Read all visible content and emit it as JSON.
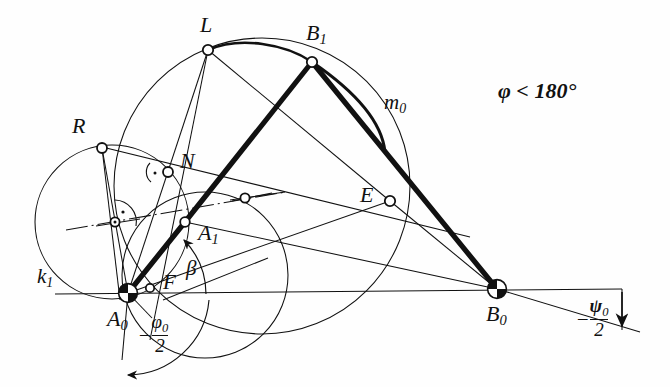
{
  "figure": {
    "type": "geometric-construction-diagram",
    "condition_note": "φ < 180°",
    "background_color": "#fefefe",
    "ink_color": "#111111"
  },
  "labels": {
    "L": "L",
    "B1_base": "B",
    "B1_sub": "1",
    "R": "R",
    "N": "N",
    "A1_base": "A",
    "A1_sub": "1",
    "E": "E",
    "F": "F",
    "beta": "β",
    "m0_base": "m",
    "m0_sub": "0",
    "k1_base": "k",
    "k1_sub": "1",
    "A0_base": "A",
    "A0_sub": "0",
    "B0_base": "B",
    "B0_sub": "0",
    "condition": "φ < 180°",
    "phi_minus": "–",
    "phi_num_base": "φ",
    "phi_num_sub": "0",
    "phi_den": "2",
    "psi_minus": "–",
    "psi_num_base": "ψ",
    "psi_num_sub": "0",
    "psi_den": "2"
  },
  "points": {
    "A0": {
      "x": 128,
      "y": 293,
      "marker": "hatched-pivot"
    },
    "B0": {
      "x": 497,
      "y": 289,
      "marker": "hatched-pivot"
    },
    "A1": {
      "x": 185,
      "y": 222,
      "marker": "open-circle"
    },
    "B1": {
      "x": 312,
      "y": 62,
      "marker": "open-circle"
    },
    "L": {
      "x": 208,
      "y": 50,
      "marker": "open-circle"
    },
    "R": {
      "x": 102,
      "y": 148,
      "marker": "open-circle"
    },
    "N": {
      "x": 168,
      "y": 172,
      "marker": "open-circle"
    },
    "E": {
      "x": 390,
      "y": 201,
      "marker": "open-circle"
    },
    "F": {
      "x": 150,
      "y": 288,
      "marker": "open-circle"
    },
    "M1": {
      "x": 115,
      "y": 222,
      "marker": "open-circle-dot"
    },
    "M2": {
      "x": 245,
      "y": 198,
      "marker": "open-circle"
    }
  },
  "circles": {
    "k1": {
      "cx": 112,
      "cy": 222,
      "r": 77,
      "label": "k1"
    },
    "big": {
      "cx": 262,
      "cy": 186,
      "r": 148
    },
    "lower_small": {
      "cx": 205,
      "cy": 275,
      "r": 83
    }
  },
  "arcs": {
    "m0": {
      "from": "B1",
      "to": "tangent-point",
      "label": "m0",
      "weight": "thick"
    },
    "L_to_B1": {
      "from": "L",
      "to": "B1",
      "weight": "medium"
    }
  },
  "links": [
    {
      "name": "A0-A1-B1",
      "weight": "thick"
    },
    {
      "name": "B1-B0",
      "weight": "thick"
    }
  ],
  "angles": {
    "beta": {
      "at": "A0",
      "label": "β",
      "direction": "ccw-arrow"
    },
    "phi_half": {
      "at": "A0",
      "label": "-φ₀/2",
      "direction": "cw-arrow"
    },
    "psi_half": {
      "at": "B0",
      "label": "-ψ₀/2",
      "direction": "down-arrow"
    }
  },
  "right_angle_markers": [
    {
      "at": "N"
    },
    {
      "at": "M1"
    }
  ]
}
